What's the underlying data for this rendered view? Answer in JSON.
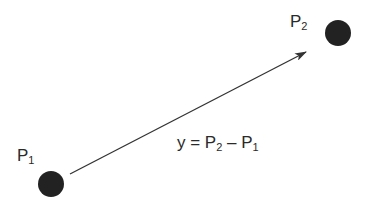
{
  "diagram": {
    "points": [
      {
        "id": "p1",
        "label": "P",
        "subscript": "1",
        "cx": 51,
        "cy": 184,
        "r": 13
      },
      {
        "id": "p2",
        "label": "P",
        "subscript": "2",
        "cx": 338,
        "cy": 33,
        "r": 13
      }
    ],
    "vector": {
      "x1": 70,
      "y1": 174,
      "x2": 306,
      "y2": 52
    },
    "equation": {
      "lhs": "y = P",
      "sub_a": "2",
      "op": " – P",
      "sub_b": "1"
    },
    "colors": {
      "point": "#222222",
      "line": "#333333",
      "text": "#2a2a2a"
    }
  }
}
